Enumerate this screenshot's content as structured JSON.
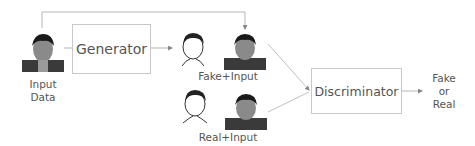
{
  "diagram": {
    "nodes": {
      "input": {
        "label_line1": "Input",
        "label_line2": "Data"
      },
      "generator": {
        "label": "Generator"
      },
      "fake_pair": {
        "label": "Fake+Input"
      },
      "real_pair": {
        "label": "Real+Input"
      },
      "discriminator": {
        "label": "Discriminator"
      },
      "output": {
        "line1": "Fake",
        "line2": "or",
        "line3": "Real"
      }
    },
    "colors": {
      "line": "#b0b0b0",
      "text": "#555555",
      "box_border": "#c8c8c8"
    }
  }
}
